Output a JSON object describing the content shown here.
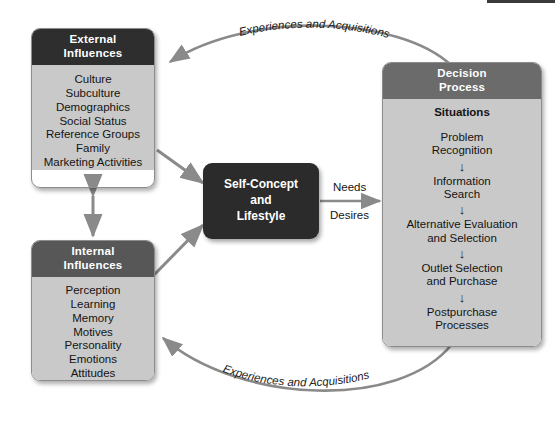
{
  "diagram": {
    "colors": {
      "external_header": "#2e2e2e",
      "internal_header": "#575757",
      "decision_header": "#6b6b6b",
      "panel_body": "#c9c9c9",
      "center_box": "#2b2b2b",
      "arrow": "#8a8a8a",
      "flow_arrow": "#111111"
    }
  },
  "external": {
    "title_line1": "External",
    "title_line2": "Influences",
    "items": [
      "Culture",
      "Subculture",
      "Demographics",
      "Social Status",
      "Reference Groups",
      "Family",
      "Marketing Activities"
    ]
  },
  "internal": {
    "title_line1": "Internal",
    "title_line2": "Influences",
    "items": [
      "Perception",
      "Learning",
      "Memory",
      "Motives",
      "Personality",
      "Emotions",
      "Attitudes"
    ]
  },
  "center": {
    "line1": "Self-Concept",
    "line2": "and",
    "line3": "Lifestyle"
  },
  "decision": {
    "title_line1": "Decision",
    "title_line2": "Process",
    "situations_label": "Situations",
    "steps": [
      {
        "line1": "Problem",
        "line2": "Recognition"
      },
      {
        "line1": "Information",
        "line2": "Search"
      },
      {
        "line1": "Alternative Evaluation",
        "line2": "and Selection"
      },
      {
        "line1": "Outlet Selection",
        "line2": "and Purchase"
      },
      {
        "line1": "Postpurchase",
        "line2": "Processes"
      }
    ],
    "step_arrow_glyph": "↓"
  },
  "connectors": {
    "needs_label": "Needs",
    "desires_label": "Desires",
    "top_arc_label": "Experiences and Acquisitions",
    "bottom_arc_label": "Experiences and Acquisitions"
  }
}
